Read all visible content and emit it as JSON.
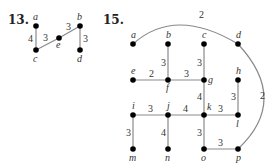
{
  "problems": [
    {
      "number": "13.",
      "vertices": [
        "a",
        "b",
        "c",
        "d",
        "e"
      ],
      "edges": [
        {
          "from": "a",
          "to": "c",
          "weight": "4"
        },
        {
          "from": "c",
          "to": "e",
          "weight": "3"
        },
        {
          "from": "e",
          "to": "b",
          "weight": "3"
        },
        {
          "from": "b",
          "to": "d",
          "weight": "3"
        }
      ]
    },
    {
      "number": "15.",
      "vertices": [
        "a",
        "b",
        "c",
        "d",
        "e",
        "f",
        "g",
        "h",
        "i",
        "j",
        "k",
        "l",
        "m",
        "n",
        "o",
        "p"
      ],
      "edges": [
        {
          "from": "a",
          "to": "d",
          "weight": "2",
          "curved": true
        },
        {
          "from": "d",
          "to": "p",
          "weight": "2",
          "curved": true
        },
        {
          "from": "b",
          "to": "f",
          "weight": "3"
        },
        {
          "from": "c",
          "to": "g",
          "weight": "3"
        },
        {
          "from": "e",
          "to": "f",
          "weight": "2"
        },
        {
          "from": "f",
          "to": "g",
          "weight": "3"
        },
        {
          "from": "g",
          "to": "k",
          "weight": "4"
        },
        {
          "from": "h",
          "to": "l",
          "weight": "3"
        },
        {
          "from": "i",
          "to": "j",
          "weight": "3"
        },
        {
          "from": "j",
          "to": "k",
          "weight": "4"
        },
        {
          "from": "k",
          "to": "l",
          "weight": "3"
        },
        {
          "from": "i",
          "to": "m",
          "weight": "3"
        },
        {
          "from": "j",
          "to": "n",
          "weight": "4"
        },
        {
          "from": "k",
          "to": "o",
          "weight": "3"
        },
        {
          "from": "o",
          "to": "p",
          "weight": "3"
        }
      ]
    }
  ]
}
